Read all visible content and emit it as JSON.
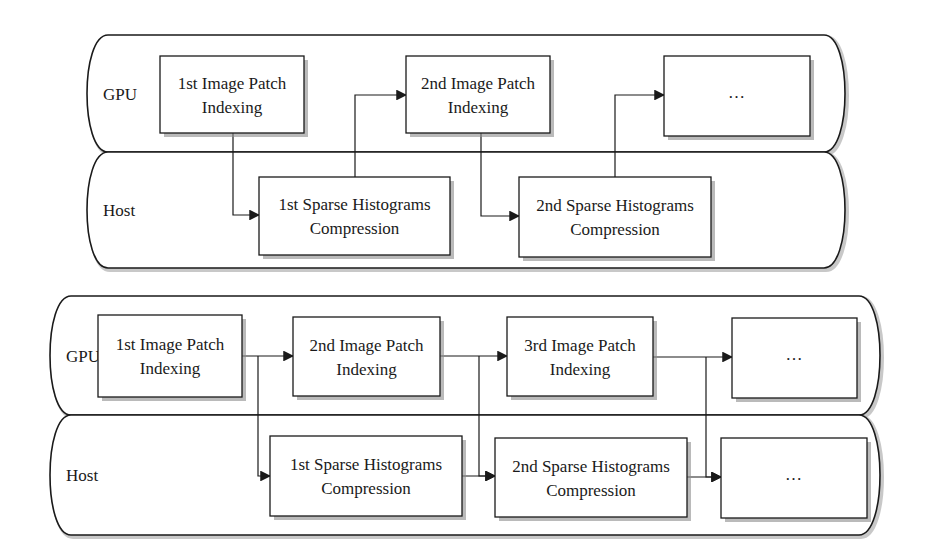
{
  "diagrams": [
    {
      "id": "sequential-pipeline",
      "lanes": [
        {
          "label": "GPU",
          "y": 35,
          "h": 117
        },
        {
          "label": "Host",
          "y": 152,
          "h": 116
        }
      ],
      "frame": {
        "x": 82,
        "w": 768
      },
      "boxes": [
        {
          "id": "gpu-1",
          "lane": "GPU",
          "lines": [
            "1st Image Patch",
            "Indexing"
          ],
          "x": 160,
          "y": 56,
          "w": 144,
          "h": 77
        },
        {
          "id": "gpu-2",
          "lane": "GPU",
          "lines": [
            "2nd Image Patch",
            "Indexing"
          ],
          "x": 406,
          "y": 56,
          "w": 144,
          "h": 77
        },
        {
          "id": "gpu-3",
          "lane": "GPU",
          "lines": [
            "..."
          ],
          "x": 664,
          "y": 56,
          "w": 146,
          "h": 80
        },
        {
          "id": "host-1",
          "lane": "Host",
          "lines": [
            "1st Sparse Histograms",
            "Compression"
          ],
          "x": 259,
          "y": 177,
          "w": 191,
          "h": 78
        },
        {
          "id": "host-2",
          "lane": "Host",
          "lines": [
            "2nd Sparse Histograms",
            "Compression"
          ],
          "x": 519,
          "y": 177,
          "w": 192,
          "h": 80
        }
      ],
      "connectors": [
        {
          "from": "gpu-1",
          "to": "host-1",
          "points": [
            [
              233,
              133
            ],
            [
              233,
              215
            ],
            [
              259,
              215
            ]
          ]
        },
        {
          "from": "host-1",
          "to": "gpu-2",
          "points": [
            [
              355,
              177
            ],
            [
              355,
              95
            ],
            [
              406,
              95
            ]
          ]
        },
        {
          "from": "gpu-2",
          "to": "host-2",
          "points": [
            [
              481,
              133
            ],
            [
              481,
              216
            ],
            [
              519,
              216
            ]
          ]
        },
        {
          "from": "host-2",
          "to": "gpu-3",
          "points": [
            [
              615,
              177
            ],
            [
              615,
              95
            ],
            [
              664,
              95
            ]
          ]
        }
      ]
    },
    {
      "id": "overlapped-pipeline",
      "lanes": [
        {
          "label": "GPU",
          "y": 296,
          "h": 119
        },
        {
          "label": "Host",
          "y": 415,
          "h": 120
        }
      ],
      "frame": {
        "x": 45,
        "w": 840
      },
      "boxes": [
        {
          "id": "gpu-1",
          "lane": "GPU",
          "lines": [
            "1st Image Patch",
            "Indexing"
          ],
          "x": 98,
          "y": 315,
          "w": 144,
          "h": 82
        },
        {
          "id": "gpu-2",
          "lane": "GPU",
          "lines": [
            "2nd Image Patch",
            "Indexing"
          ],
          "x": 293,
          "y": 317,
          "w": 147,
          "h": 79
        },
        {
          "id": "gpu-3",
          "lane": "GPU",
          "lines": [
            "3rd Image Patch",
            "Indexing"
          ],
          "x": 507,
          "y": 317,
          "w": 146,
          "h": 79
        },
        {
          "id": "gpu-4",
          "lane": "GPU",
          "lines": [
            "..."
          ],
          "x": 732,
          "y": 318,
          "w": 125,
          "h": 80
        },
        {
          "id": "host-1",
          "lane": "Host",
          "lines": [
            "1st Sparse Histograms",
            "Compression"
          ],
          "x": 270,
          "y": 436,
          "w": 192,
          "h": 80
        },
        {
          "id": "host-2",
          "lane": "Host",
          "lines": [
            "2nd Sparse Histograms",
            "Compression"
          ],
          "x": 495,
          "y": 438,
          "w": 192,
          "h": 79
        },
        {
          "id": "host-3",
          "lane": "Host",
          "lines": [
            "..."
          ],
          "x": 721,
          "y": 438,
          "w": 146,
          "h": 80
        }
      ],
      "connectors": [
        {
          "from": "gpu-1",
          "to": "gpu-2",
          "points": [
            [
              242,
              356
            ],
            [
              293,
              356
            ]
          ]
        },
        {
          "from": "gpu-1",
          "to": "host-1",
          "points": [
            [
              258,
              356
            ],
            [
              258,
              476
            ],
            [
              270,
              476
            ]
          ]
        },
        {
          "from": "gpu-2",
          "to": "gpu-3",
          "points": [
            [
              440,
              356
            ],
            [
              507,
              356
            ]
          ]
        },
        {
          "from": "gpu-2",
          "to": "host-2",
          "points": [
            [
              479,
              356
            ],
            [
              479,
              476
            ],
            [
              495,
              476
            ]
          ]
        },
        {
          "from": "host-1",
          "to": "host-2",
          "points": [
            [
              462,
              476
            ],
            [
              495,
              476
            ]
          ]
        },
        {
          "from": "gpu-3",
          "to": "gpu-4",
          "points": [
            [
              653,
              357
            ],
            [
              732,
              357
            ]
          ]
        },
        {
          "from": "gpu-3",
          "to": "host-3",
          "points": [
            [
              706,
              357
            ],
            [
              706,
              477
            ],
            [
              721,
              477
            ]
          ]
        },
        {
          "from": "host-2",
          "to": "host-3",
          "points": [
            [
              687,
              477
            ],
            [
              721,
              477
            ]
          ]
        }
      ]
    }
  ]
}
